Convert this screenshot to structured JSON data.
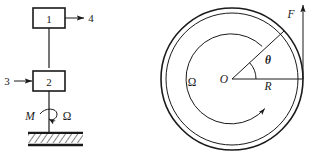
{
  "figure": {
    "type": "engineering-schematic",
    "background_color": "#ffffff",
    "line_color": "#1a1a1a"
  },
  "left_diagram": {
    "name": "block-chain-schematic",
    "blocks": [
      {
        "id": "block-1",
        "label": "1"
      },
      {
        "id": "block-2",
        "label": "2"
      }
    ],
    "arrows": [
      {
        "id": "arrow-4",
        "label": "4",
        "direction": "right",
        "from": "block-1"
      },
      {
        "id": "arrow-3",
        "label": "3",
        "direction": "right",
        "to": "block-2"
      }
    ],
    "torque_label": "M",
    "angular_speed_label": "Ω",
    "ground": {
      "name": "hatched-ground",
      "style": "hatched-band"
    }
  },
  "right_diagram": {
    "name": "rotating-disc",
    "center_label": "O",
    "radius_label": "R",
    "angle_label": "θ",
    "force_label": "F",
    "angular_speed_label": "Ω",
    "geometry": {
      "center_x": 232,
      "center_y": 79,
      "outer_radius": 71,
      "inner_radius": 67,
      "rotation_arc_radius": 45,
      "angle_arc_radius": 24,
      "theta_degrees": 43,
      "rotation_direction": "counterclockwise"
    }
  }
}
